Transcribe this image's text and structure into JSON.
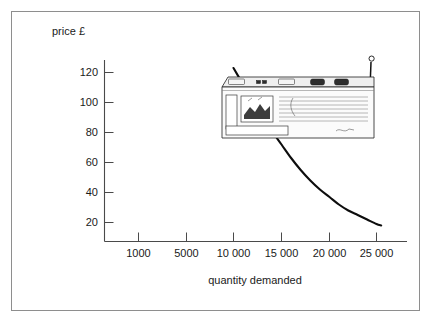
{
  "figure": {
    "frame_border_color": "#8e8e8e",
    "background_color": "#ffffff"
  },
  "illustration": {
    "name": "portable-radio-cassette-player",
    "description": "line drawing of a portable radio cassette player with extended antenna"
  },
  "chart_data": {
    "type": "line",
    "title": "",
    "subtitle": "",
    "xlabel": "quantity demanded",
    "ylabel": "price £",
    "ylabel_display": "price £",
    "grid": false,
    "legend": null,
    "curve_color": "#0d0d0d",
    "x_tick_labels": [
      "1000",
      "5000",
      "10 000",
      "15 000",
      "20 000",
      "25 000"
    ],
    "x_tick_values": [
      1000,
      5000,
      10000,
      15000,
      20000,
      25000
    ],
    "y_tick_labels": [
      "20",
      "40",
      "60",
      "80",
      "100",
      "120"
    ],
    "y_tick_values": [
      20,
      40,
      60,
      80,
      100,
      120
    ],
    "ylim": [
      0,
      130
    ],
    "series": [
      {
        "name": "demand curve",
        "x": [
          10000,
          11000,
          12000,
          13000,
          14000,
          15000,
          16000,
          17000,
          18000,
          19000,
          20000,
          21000,
          22000,
          23000,
          24000,
          25000,
          25500
        ],
        "y": [
          123,
          112,
          101,
          91,
          81,
          72,
          63,
          55,
          48,
          42,
          37,
          32,
          28,
          25,
          22,
          19,
          18
        ]
      }
    ]
  }
}
